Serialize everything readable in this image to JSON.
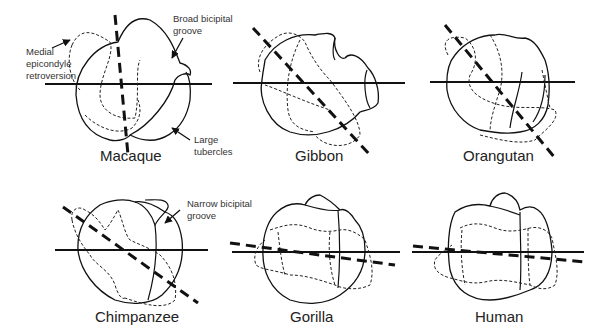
{
  "figure": {
    "panels": [
      {
        "id": "macaque",
        "label": "Macaque"
      },
      {
        "id": "gibbon",
        "label": "Gibbon"
      },
      {
        "id": "orangutan",
        "label": "Orangutan"
      },
      {
        "id": "chimpanzee",
        "label": "Chimpanzee"
      },
      {
        "id": "gorilla",
        "label": "Gorilla"
      },
      {
        "id": "human",
        "label": "Human"
      }
    ],
    "annotations": {
      "medial_epicondyle": [
        "Medial",
        "epicondyle",
        "retroversion"
      ],
      "broad_groove": [
        "Broad bicipital",
        "groove"
      ],
      "large_tubercles": [
        "Large",
        "tubercles"
      ],
      "narrow_groove": [
        "Narrow bicipital",
        "groove"
      ]
    },
    "legend_semantics": {
      "solid_horizontal_line": "reference axis",
      "thick_dashed_line": "humeral head torsion axis",
      "solid_outline": "proximal humerus outline",
      "thin_dashed_outline": "distal humerus outline"
    }
  }
}
